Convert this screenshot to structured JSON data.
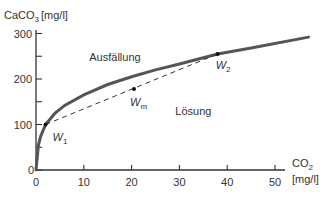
{
  "chart_data": {
    "type": "line",
    "title": "",
    "ylabel": "CaCO3 [mg/l]",
    "ylabel_main": "CaCO",
    "ylabel_sub": "3",
    "ylabel_unit": "[mg/l]",
    "xlabel_main": "CO",
    "xlabel_sub": "2",
    "xlabel_unit": "[mg/l]",
    "xlim": [
      0,
      57
    ],
    "ylim": [
      0,
      300
    ],
    "x_ticks": [
      0,
      10,
      20,
      30,
      40,
      50
    ],
    "y_ticks": [
      0,
      100,
      200,
      300
    ],
    "y_minor_ticks": [
      50,
      150,
      250
    ],
    "grid": false,
    "series": [
      {
        "name": "Kalk-Kohlensäure-Gleichgewichtskurve",
        "style": "solid",
        "x": [
          0,
          0.5,
          1,
          2,
          4,
          6,
          10,
          15,
          20,
          25,
          30,
          38,
          45,
          57
        ],
        "y": [
          0,
          55,
          75,
          100,
          125,
          142,
          165,
          188,
          205,
          220,
          233,
          255,
          268,
          292
        ]
      },
      {
        "name": "Mischungsgerade W1–W2",
        "style": "dashed",
        "x": [
          2,
          38
        ],
        "y": [
          100,
          255
        ]
      }
    ],
    "points": [
      {
        "name": "W1",
        "label": "W",
        "sub": "1",
        "x": 2,
        "y": 100
      },
      {
        "name": "Wm",
        "label": "W",
        "sub": "m",
        "x": 20.5,
        "y": 178
      },
      {
        "name": "W2",
        "label": "W",
        "sub": "2",
        "x": 38,
        "y": 255
      }
    ],
    "annotations": [
      {
        "text": "Ausfällung",
        "x": 17,
        "y": 240
      },
      {
        "text": "Lösung",
        "x": 35,
        "y": 120
      }
    ]
  }
}
